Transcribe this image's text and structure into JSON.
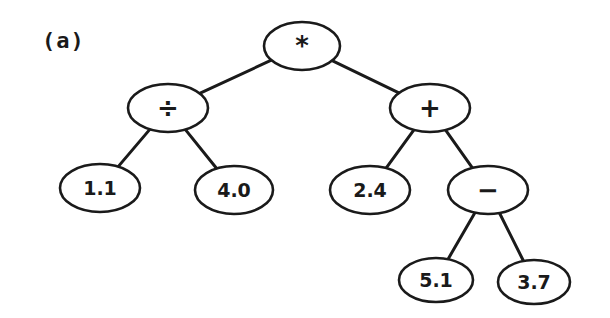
{
  "figure_label": "(a)",
  "tree": {
    "nodes": [
      {
        "id": "root",
        "label": "*",
        "type": "operator",
        "cx": 302,
        "cy": 46,
        "rx": 38,
        "ry": 24
      },
      {
        "id": "div",
        "label": "÷",
        "type": "operator",
        "cx": 168,
        "cy": 108,
        "rx": 40,
        "ry": 24
      },
      {
        "id": "plus",
        "label": "+",
        "type": "operator",
        "cx": 430,
        "cy": 108,
        "rx": 40,
        "ry": 24
      },
      {
        "id": "n11",
        "label": "1.1",
        "type": "operand",
        "cx": 100,
        "cy": 188,
        "rx": 40,
        "ry": 24
      },
      {
        "id": "n40",
        "label": "4.0",
        "type": "operand",
        "cx": 234,
        "cy": 190,
        "rx": 39,
        "ry": 24
      },
      {
        "id": "n24",
        "label": "2.4",
        "type": "operand",
        "cx": 370,
        "cy": 190,
        "rx": 40,
        "ry": 24
      },
      {
        "id": "minus",
        "label": "−",
        "type": "operator",
        "cx": 488,
        "cy": 190,
        "rx": 40,
        "ry": 24
      },
      {
        "id": "n51",
        "label": "5.1",
        "type": "operand",
        "cx": 436,
        "cy": 280,
        "rx": 37,
        "ry": 22
      },
      {
        "id": "n37",
        "label": "3.7",
        "type": "operand",
        "cx": 534,
        "cy": 282,
        "rx": 36,
        "ry": 22
      }
    ],
    "edges": [
      [
        "root",
        "div"
      ],
      [
        "root",
        "plus"
      ],
      [
        "div",
        "n11"
      ],
      [
        "div",
        "n40"
      ],
      [
        "plus",
        "n24"
      ],
      [
        "plus",
        "minus"
      ],
      [
        "minus",
        "n51"
      ],
      [
        "minus",
        "n37"
      ]
    ]
  },
  "colors": {
    "stroke": "#1a1a1a",
    "fill": "#ffffff",
    "background": "#ffffff"
  }
}
